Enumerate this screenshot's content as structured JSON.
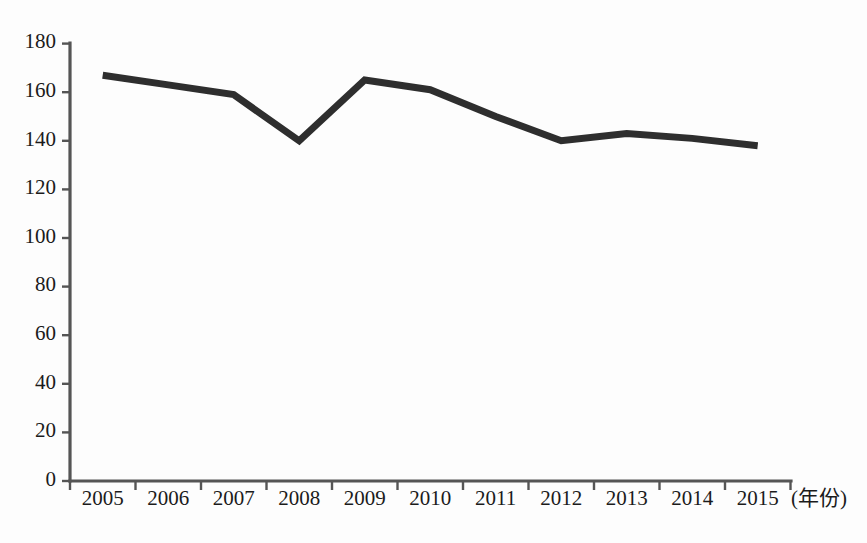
{
  "chart_data": {
    "type": "line",
    "title": "",
    "subtitle": "",
    "xlabel": "(年份)",
    "ylabel": "",
    "categories": [
      "2005",
      "2006",
      "2007",
      "2008",
      "2009",
      "2010",
      "2011",
      "2012",
      "2013",
      "2014",
      "2015"
    ],
    "x": [
      2005,
      2006,
      2007,
      2008,
      2009,
      2010,
      2011,
      2012,
      2013,
      2014,
      2015
    ],
    "values": [
      167,
      163,
      159,
      140,
      165,
      161,
      150,
      140,
      143,
      141,
      138
    ],
    "series": [
      {
        "name": "",
        "values": [
          167,
          163,
          159,
          140,
          165,
          161,
          150,
          140,
          143,
          141,
          138
        ]
      }
    ],
    "ylim": [
      0,
      180
    ],
    "yticks": [
      0,
      20,
      40,
      60,
      80,
      100,
      120,
      140,
      160,
      180
    ],
    "ytick_labels": [
      "0",
      "20",
      "40",
      "60",
      "80",
      "100",
      "120",
      "140",
      "160",
      "180"
    ],
    "grid": false,
    "legend": false,
    "legend_position": "none",
    "line_color": "#2e2e2e",
    "axis_color": "#555555",
    "background_color": "#fdfdfd",
    "markers": false,
    "annotations": []
  },
  "axes": {
    "x_axis_unit": "(年份)",
    "y_axis_unit": ""
  }
}
